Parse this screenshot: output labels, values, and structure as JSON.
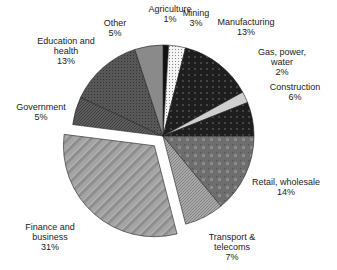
{
  "chart_data": {
    "type": "pie",
    "title": "",
    "start_angle_deg": 0,
    "direction": "clockwise",
    "center": [
      163,
      136
    ],
    "radius": 91,
    "exploded": [
      "Finance and business"
    ],
    "explode_offset": 13,
    "slices": [
      {
        "label": "Agriculture",
        "label_lines": [
          "Agriculture"
        ],
        "value": 1,
        "pct": "1%",
        "fill": "#111111",
        "pattern": "solid",
        "label_pos": [
          170,
          4
        ]
      },
      {
        "label": "Mining",
        "label_lines": [
          "Mining"
        ],
        "value": 3,
        "pct": "3%",
        "fill": "#f2f2f2",
        "pattern": "dots",
        "label_pos": [
          196,
          8
        ]
      },
      {
        "label": "Manufacturing",
        "label_lines": [
          "Manufacturing"
        ],
        "value": 13,
        "pct": "13%",
        "fill": "#1c1c1c",
        "pattern": "darkcross",
        "label_pos": [
          246,
          17
        ]
      },
      {
        "label": "Gas, power, water",
        "label_lines": [
          "Gas, power,",
          "water"
        ],
        "value": 2,
        "pct": "2%",
        "fill": "#cfcfcf",
        "pattern": "solid",
        "label_pos": [
          282,
          47
        ]
      },
      {
        "label": "Construction",
        "label_lines": [
          "Construction"
        ],
        "value": 6,
        "pct": "6%",
        "fill": "#3a3a3a",
        "pattern": "darkcross",
        "label_pos": [
          295,
          82
        ]
      },
      {
        "label": "Retail, wholesale",
        "label_lines": [
          "Retail, wholesale"
        ],
        "value": 14,
        "pct": "14%",
        "fill": "#6b6b6b",
        "pattern": "grid",
        "label_pos": [
          286,
          177
        ]
      },
      {
        "label": "Transport & telecoms",
        "label_lines": [
          "Transport &",
          "telecoms"
        ],
        "value": 7,
        "pct": "7%",
        "fill": "#a0a0a0",
        "pattern": "diag",
        "label_pos": [
          232,
          232
        ]
      },
      {
        "label": "Finance and business",
        "label_lines": [
          "Finance and",
          "business"
        ],
        "value": 31,
        "pct": "31%",
        "fill": "#9a9a9a",
        "pattern": "stripes",
        "label_pos": [
          50,
          222
        ]
      },
      {
        "label": "Government",
        "label_lines": [
          "Government"
        ],
        "value": 5,
        "pct": "5%",
        "fill": "#5a5a5a",
        "pattern": "diag",
        "label_pos": [
          41,
          102
        ]
      },
      {
        "label": "Education and health",
        "label_lines": [
          "Education and",
          "health"
        ],
        "value": 13,
        "pct": "13%",
        "fill": "#525252",
        "pattern": "crosshatch",
        "label_pos": [
          66,
          36
        ]
      },
      {
        "label": "Other",
        "label_lines": [
          "Other"
        ],
        "value": 5,
        "pct": "5%",
        "fill": "#8a8a8a",
        "pattern": "solid",
        "label_pos": [
          115,
          18
        ]
      }
    ],
    "legend": "none (labels placed around pie)"
  }
}
